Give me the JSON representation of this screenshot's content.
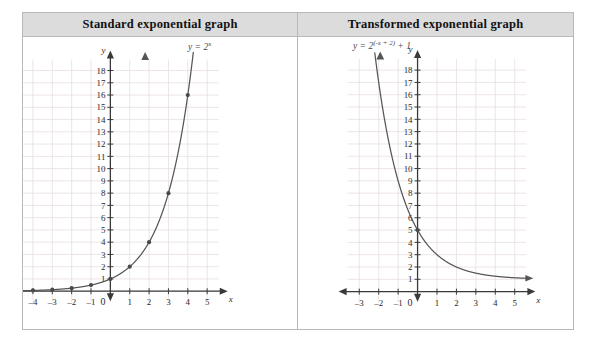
{
  "table": {
    "columns": [
      {
        "header": "Standard exponential graph"
      },
      {
        "header": "Transformed exponential graph"
      }
    ]
  },
  "chart_data": [
    {
      "type": "line",
      "title": "Standard exponential graph",
      "equation_label": "y = 2",
      "equation_exponent": "x",
      "equation_plain": "y = 2^x",
      "xlabel": "x",
      "ylabel": "y",
      "xlim": [
        -4.6,
        5.6
      ],
      "ylim": [
        -1.2,
        19
      ],
      "xticks": [
        -4,
        -3,
        -2,
        -1,
        0,
        1,
        2,
        3,
        4,
        5
      ],
      "yticks": [
        1,
        2,
        3,
        4,
        5,
        6,
        7,
        8,
        9,
        10,
        11,
        12,
        13,
        14,
        15,
        16,
        17,
        18
      ],
      "origin_label": "0",
      "grid": true,
      "grid_color": "#e8dede",
      "axis_color": "#3a3a3a",
      "curve_color": "#555555",
      "points": [
        {
          "x": -4,
          "y": 0.0625
        },
        {
          "x": -3,
          "y": 0.125
        },
        {
          "x": -2,
          "y": 0.25
        },
        {
          "x": -1,
          "y": 0.5
        },
        {
          "x": 0,
          "y": 1
        },
        {
          "x": 1,
          "y": 2
        },
        {
          "x": 2,
          "y": 4
        },
        {
          "x": 3,
          "y": 8
        },
        {
          "x": 4,
          "y": 16
        }
      ]
    },
    {
      "type": "line",
      "title": "Transformed exponential graph",
      "equation_label": "y = 2",
      "equation_exponent": "(-x + 2)",
      "equation_suffix": " + 1",
      "equation_plain": "y = 2^(-x+2) + 1",
      "xlabel": "x",
      "ylabel": "y",
      "xlim": [
        -3.6,
        5.6
      ],
      "ylim": [
        -1.2,
        19
      ],
      "xticks": [
        -3,
        -2,
        -1,
        0,
        1,
        2,
        3,
        4,
        5
      ],
      "yticks": [
        1,
        2,
        3,
        4,
        5,
        6,
        7,
        8,
        9,
        10,
        11,
        12,
        13,
        14,
        15,
        16,
        17,
        18
      ],
      "origin_label": "0",
      "grid": true,
      "grid_color": "#e8dede",
      "axis_color": "#3a3a3a",
      "curve_color": "#555555",
      "asymptote": 1,
      "points": [
        {
          "x": 0,
          "y": 5
        }
      ]
    }
  ]
}
